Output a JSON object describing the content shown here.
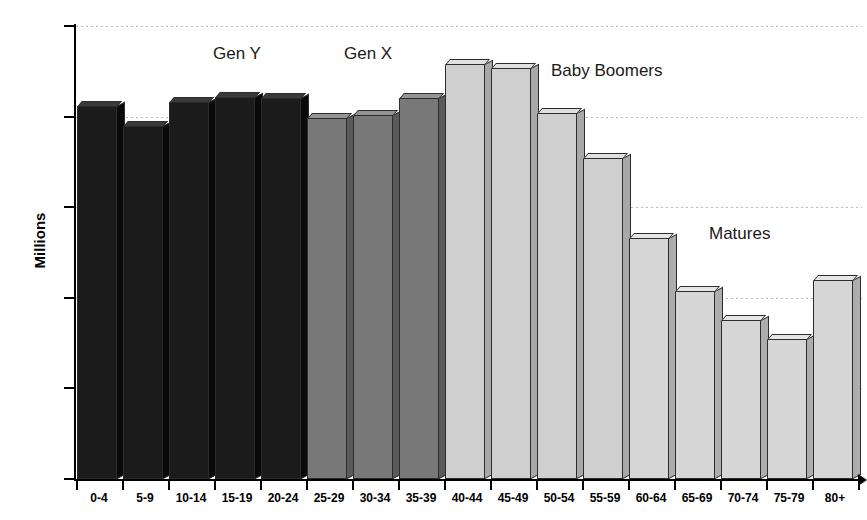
{
  "chart_data": {
    "type": "bar",
    "title": "",
    "xlabel": "",
    "ylabel": "Millions",
    "ylim": [
      0,
      25
    ],
    "yticks": [
      0,
      5,
      10,
      15,
      20,
      25
    ],
    "grid": true,
    "legend": "none",
    "categories": [
      "0-4",
      "5-9",
      "10-14",
      "15-19",
      "20-24",
      "25-29",
      "30-34",
      "35-39",
      "40-44",
      "45-49",
      "50-54",
      "55-59",
      "60-64",
      "65-69",
      "70-74",
      "75-79",
      "80+"
    ],
    "values": [
      20.6,
      19.5,
      20.8,
      21.1,
      21.0,
      19.9,
      20.1,
      21.0,
      22.9,
      22.7,
      20.2,
      17.7,
      13.3,
      10.4,
      8.8,
      7.7,
      11.0
    ],
    "groups": [
      {
        "name": "Gen Y",
        "categories": [
          "0-4",
          "5-9",
          "10-14",
          "15-19",
          "20-24"
        ],
        "color": "#1b1b1b"
      },
      {
        "name": "Gen X",
        "categories": [
          "25-29",
          "30-34",
          "35-39"
        ],
        "color": "#787878"
      },
      {
        "name": "Baby Boomers",
        "categories": [
          "40-44",
          "45-49",
          "50-54",
          "55-59"
        ],
        "color": "#cfcfcf"
      },
      {
        "name": "Matures",
        "categories": [
          "60-64",
          "65-69",
          "70-74",
          "75-79",
          "80+"
        ],
        "color": "#d6d6d6"
      }
    ],
    "annotations": [
      {
        "text": "Gen Y",
        "near_category": "10-14"
      },
      {
        "text": "Gen X",
        "near_category": "25-29"
      },
      {
        "text": "Baby Boomers",
        "near_category": "50-54"
      },
      {
        "text": "Matures",
        "near_category": "70-74"
      }
    ]
  },
  "axis": {
    "y_title": "Millions",
    "y_tick_labels": [
      "25",
      "20",
      "15",
      "10",
      "5",
      "0"
    ],
    "x_tick_labels": [
      "0-4",
      "5-9",
      "10-14",
      "15-19",
      "20-24",
      "25-29",
      "30-34",
      "35-39",
      "40-44",
      "45-49",
      "50-54",
      "55-59",
      "60-64",
      "65-69",
      "70-74",
      "75-79",
      "80+"
    ]
  },
  "annotations": {
    "gen_y": "Gen Y",
    "gen_x": "Gen X",
    "baby_boomers": "Baby Boomers",
    "matures": "Matures"
  }
}
